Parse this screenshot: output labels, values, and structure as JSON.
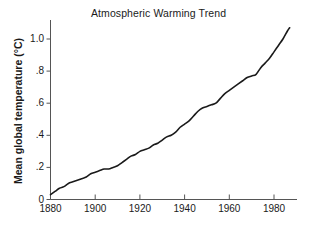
{
  "chart_data": {
    "type": "line",
    "title": "Atmospheric Warming Trend",
    "xlabel": "",
    "ylabel": "Mean global temperature (°C)",
    "xlim": [
      1880,
      1990
    ],
    "ylim": [
      0,
      1.1
    ],
    "xticks": [
      1880,
      1900,
      1920,
      1940,
      1960,
      1980
    ],
    "xticklabels": [
      "1880",
      "1900",
      "1920",
      "1940",
      "1960",
      "1980"
    ],
    "yticks": [
      0,
      0.2,
      0.4,
      0.6,
      0.8,
      1.0
    ],
    "yticklabels": [
      "0",
      ".2",
      ".4",
      ".6",
      ".8",
      "1.0"
    ],
    "grid": false,
    "legend": null,
    "line_color": "#1a1a1a",
    "line_width": 1.6,
    "x": [
      1880,
      1882,
      1884,
      1886,
      1888,
      1890,
      1892,
      1894,
      1896,
      1898,
      1900,
      1902,
      1904,
      1906,
      1908,
      1910,
      1912,
      1914,
      1916,
      1918,
      1920,
      1922,
      1924,
      1926,
      1928,
      1930,
      1932,
      1934,
      1936,
      1938,
      1940,
      1942,
      1944,
      1946,
      1948,
      1950,
      1952,
      1954,
      1956,
      1958,
      1960,
      1962,
      1964,
      1966,
      1968,
      1970,
      1972,
      1974,
      1976,
      1978,
      1980,
      1982,
      1984,
      1986,
      1987
    ],
    "values": [
      0.03,
      0.05,
      0.07,
      0.08,
      0.1,
      0.11,
      0.12,
      0.13,
      0.14,
      0.16,
      0.17,
      0.18,
      0.19,
      0.19,
      0.2,
      0.21,
      0.23,
      0.25,
      0.27,
      0.28,
      0.3,
      0.31,
      0.32,
      0.34,
      0.35,
      0.37,
      0.39,
      0.4,
      0.42,
      0.45,
      0.47,
      0.49,
      0.52,
      0.55,
      0.57,
      0.58,
      0.59,
      0.6,
      0.63,
      0.66,
      0.68,
      0.7,
      0.72,
      0.74,
      0.76,
      0.77,
      0.78,
      0.82,
      0.85,
      0.88,
      0.92,
      0.96,
      1.0,
      1.05,
      1.07
    ]
  }
}
